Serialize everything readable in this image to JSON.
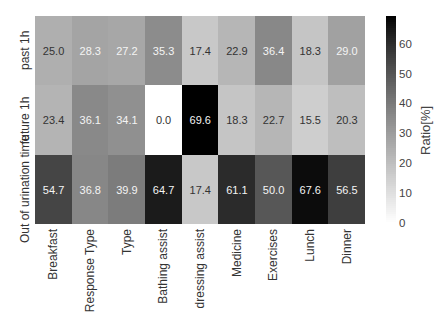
{
  "chart_data": {
    "type": "heatmap",
    "title": "",
    "xlabel": "",
    "ylabel": "",
    "x_categories": [
      "Breakfast",
      "Response Type",
      "Type",
      "Bathing assist",
      "dressing assist",
      "Medicine",
      "Exercises",
      "Lunch",
      "Dinner"
    ],
    "y_categories": [
      "past 1h",
      "future 1h",
      "Out of urination time"
    ],
    "values": [
      [
        25.0,
        28.3,
        27.2,
        35.3,
        17.4,
        22.9,
        36.4,
        18.3,
        29.0
      ],
      [
        23.4,
        36.1,
        34.1,
        0.0,
        69.6,
        18.3,
        22.7,
        15.5,
        20.3
      ],
      [
        54.7,
        36.8,
        39.9,
        64.7,
        17.4,
        61.1,
        50.0,
        67.6,
        56.5
      ]
    ],
    "colorbar": {
      "label": "Ratio[%]",
      "ticks": [
        0,
        10,
        20,
        30,
        40,
        50,
        60
      ],
      "range": [
        0,
        69.6
      ],
      "colormap": "Greys (white=low, black=high)"
    }
  }
}
